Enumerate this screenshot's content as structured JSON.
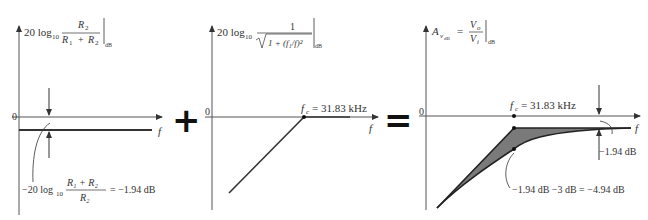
{
  "figure": {
    "panel1": {
      "ylabel_prefix": "20 log",
      "ylabel_sub": "10",
      "ylabel_num": "R",
      "ylabel_num_sub": "2",
      "ylabel_den_a": "R",
      "ylabel_den_a_sub": "1",
      "ylabel_den_plus": "+",
      "ylabel_den_b": "R",
      "ylabel_den_b_sub": "2",
      "ylabel_unit": "dB",
      "zero_label": "0",
      "xlabel": "f",
      "annotation_prefix": "−20 log",
      "annotation_sub": "10",
      "annotation_num": "R₁ + R₂",
      "annotation_den": "R₂",
      "annotation_value": "= −1.94 dB"
    },
    "operator_plus": "+",
    "panel2": {
      "ylabel_prefix": "20 log",
      "ylabel_sub": "10",
      "ylabel_num": "1",
      "ylabel_den": "1 + (f₁/f)²",
      "ylabel_unit": "dB",
      "zero_label": "0",
      "xlabel": "f",
      "fc_label": "f",
      "fc_sub": "c",
      "fc_value": "= 31.83 kHz"
    },
    "operator_equals": "=",
    "panel3": {
      "ylabel_A": "A",
      "ylabel_sub": "v",
      "ylabel_subsub": "dB",
      "ylabel_eq": "=",
      "ylabel_num": "V",
      "ylabel_num_sub": "o",
      "ylabel_den": "V",
      "ylabel_den_sub": "i",
      "ylabel_unit": "dB",
      "zero_label": "0",
      "xlabel": "f",
      "fc_label": "f",
      "fc_sub": "c",
      "fc_value": "= 31.83 kHz",
      "offset_label": "−1.94 dB",
      "combined_label": "−1.94 dB  −3 dB  =  −4.94 dB"
    }
  },
  "colors": {
    "line": "#333333",
    "fill": "#7a7a7a",
    "axis": "#555555"
  }
}
